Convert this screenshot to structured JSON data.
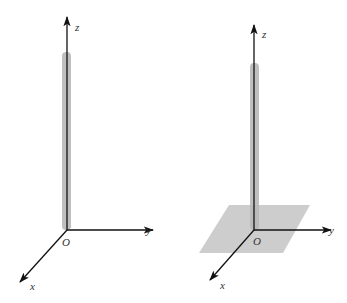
{
  "figures": [
    {
      "id": "left",
      "description": "Line segment (rod) along z-axis, no plane",
      "axes": {
        "x_label": "x",
        "y_label": "y",
        "z_label": "z",
        "origin_label": "O"
      },
      "has_plane": false
    },
    {
      "id": "right",
      "description": "Line segment (rod) along z-axis perpendicular to a plane through O",
      "axes": {
        "x_label": "x",
        "y_label": "y",
        "z_label": "z",
        "origin_label": "O"
      },
      "has_plane": true
    }
  ],
  "colors": {
    "axis": "#111111",
    "rod": "#b8b8b8",
    "plane": "#c4c4c4",
    "label": "#333333"
  }
}
